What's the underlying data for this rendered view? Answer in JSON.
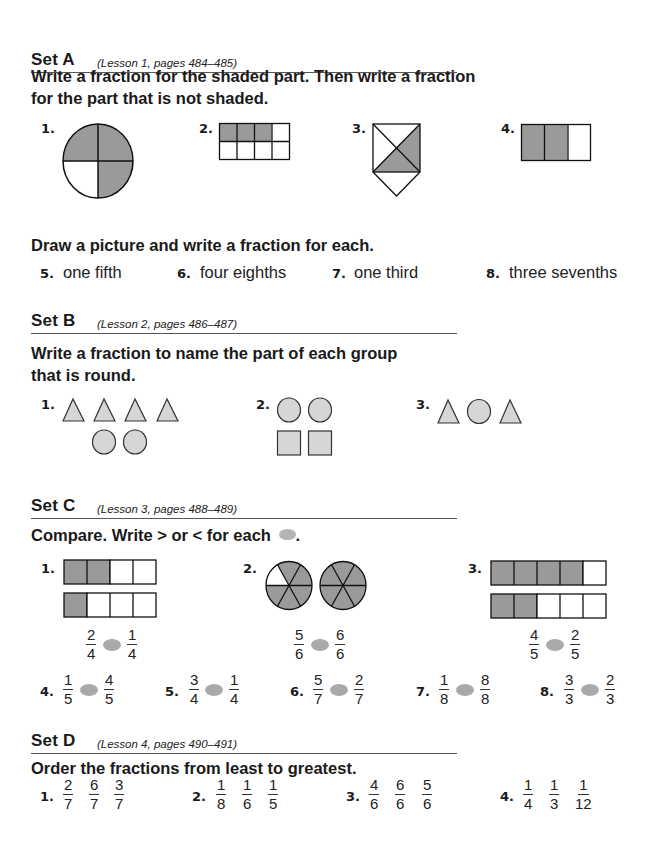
{
  "colors": {
    "shade": "#9a9a9a",
    "light_fill": "#d6d6d6",
    "compare_oval": "#a9a9a9",
    "text": "#1a1a1a"
  },
  "set_a": {
    "title": "Set A",
    "lesson": "(Lesson 1, pages 484–485)",
    "instruction_line1": "Write a fraction for the shaded part. Then write a fraction",
    "instruction_line2": "for the part that is not shaded.",
    "items": [
      {
        "num": "1.",
        "shape": "circle",
        "parts": 4,
        "shaded": 3
      },
      {
        "num": "2.",
        "shape": "grid",
        "parts": 8,
        "shaded": 3
      },
      {
        "num": "3.",
        "shape": "square-with-triangle",
        "parts": 5,
        "shaded": 2
      },
      {
        "num": "4.",
        "shape": "bar",
        "parts": 3,
        "shaded": 2
      }
    ],
    "draw_instruction": "Draw a picture and write a fraction for each.",
    "draw_items": [
      {
        "num": "5.",
        "text": "one fifth"
      },
      {
        "num": "6.",
        "text": "four eighths"
      },
      {
        "num": "7.",
        "text": "one third"
      },
      {
        "num": "8.",
        "text": "three sevenths"
      }
    ]
  },
  "set_b": {
    "title": "Set B",
    "lesson": "(Lesson 2, pages 486–487)",
    "instruction_line1": "Write a fraction to name the part of each group",
    "instruction_line2": "that is round.",
    "items": [
      {
        "num": "1.",
        "shapes": [
          "triangle",
          "triangle",
          "triangle",
          "triangle",
          "circle",
          "circle"
        ]
      },
      {
        "num": "2.",
        "shapes": [
          "circle",
          "circle",
          "square",
          "square"
        ]
      },
      {
        "num": "3.",
        "shapes": [
          "triangle",
          "circle",
          "triangle"
        ]
      }
    ]
  },
  "set_c": {
    "title": "Set C",
    "lesson": "(Lesson 3, pages 488–489)",
    "instruction": "Compare. Write > or < for each",
    "instruction_end": ".",
    "visual_items": [
      {
        "num": "1.",
        "left": {
          "n": "2",
          "d": "4"
        },
        "right": {
          "n": "1",
          "d": "4"
        }
      },
      {
        "num": "2.",
        "left": {
          "n": "5",
          "d": "6"
        },
        "right": {
          "n": "6",
          "d": "6"
        }
      },
      {
        "num": "3.",
        "left": {
          "n": "4",
          "d": "5"
        },
        "right": {
          "n": "2",
          "d": "5"
        }
      }
    ],
    "items": [
      {
        "num": "4.",
        "left": {
          "n": "1",
          "d": "5"
        },
        "right": {
          "n": "4",
          "d": "5"
        }
      },
      {
        "num": "5.",
        "left": {
          "n": "3",
          "d": "4"
        },
        "right": {
          "n": "1",
          "d": "4"
        }
      },
      {
        "num": "6.",
        "left": {
          "n": "5",
          "d": "7"
        },
        "right": {
          "n": "2",
          "d": "7"
        }
      },
      {
        "num": "7.",
        "left": {
          "n": "1",
          "d": "8"
        },
        "right": {
          "n": "8",
          "d": "8"
        }
      },
      {
        "num": "8.",
        "left": {
          "n": "3",
          "d": "3"
        },
        "right": {
          "n": "2",
          "d": "3"
        }
      }
    ]
  },
  "set_d": {
    "title": "Set D",
    "lesson": "(Lesson 4, pages 490–491)",
    "instruction": "Order the fractions from least to greatest.",
    "items": [
      {
        "num": "1.",
        "fractions": [
          {
            "n": "2",
            "d": "7"
          },
          {
            "n": "6",
            "d": "7"
          },
          {
            "n": "3",
            "d": "7"
          }
        ]
      },
      {
        "num": "2.",
        "fractions": [
          {
            "n": "1",
            "d": "8"
          },
          {
            "n": "1",
            "d": "6"
          },
          {
            "n": "1",
            "d": "5"
          }
        ]
      },
      {
        "num": "3.",
        "fractions": [
          {
            "n": "4",
            "d": "6"
          },
          {
            "n": "6",
            "d": "6"
          },
          {
            "n": "5",
            "d": "6"
          }
        ]
      },
      {
        "num": "4.",
        "fractions": [
          {
            "n": "1",
            "d": "4"
          },
          {
            "n": "1",
            "d": "3"
          },
          {
            "n": "1",
            "d": "12"
          }
        ]
      }
    ]
  }
}
